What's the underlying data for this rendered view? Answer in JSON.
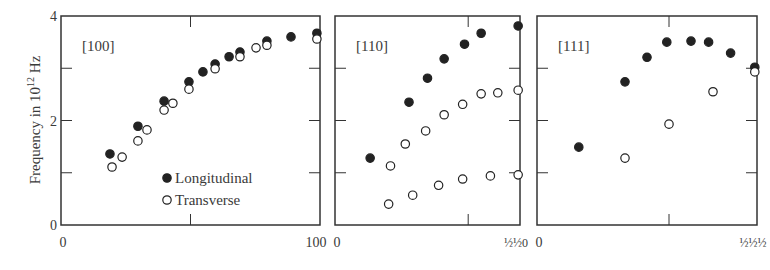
{
  "chart_data": {
    "type": "scatter",
    "ylabel": "Frequency in 10^12 Hz",
    "ylabel_main": "Frequency in 10",
    "ylabel_sup": "12",
    "ylabel_unit": "Hz",
    "ylim": [
      0,
      4
    ],
    "yticks": [
      "0",
      "2",
      "4"
    ],
    "legend": [
      {
        "name": "Longitudinal",
        "marker": "filled-circle"
      },
      {
        "name": "Transverse",
        "marker": "open-circle"
      }
    ],
    "panels": [
      {
        "title": "[100]",
        "xlim": [
          0,
          100
        ],
        "xtick_left": "0",
        "xtick_right": "100",
        "series": [
          {
            "name": "Longitudinal",
            "points": [
              [
                18.9,
                1.36
              ],
              [
                29.7,
                1.89
              ],
              [
                39.8,
                2.37
              ],
              [
                49.4,
                2.74
              ],
              [
                54.8,
                2.93
              ],
              [
                59.5,
                3.08
              ],
              [
                64.9,
                3.22
              ],
              [
                69.1,
                3.31
              ],
              [
                79.5,
                3.52
              ],
              [
                88.8,
                3.6
              ],
              [
                98.8,
                3.67
              ]
            ]
          },
          {
            "name": "Transverse",
            "points": [
              [
                19.7,
                1.11
              ],
              [
                23.6,
                1.3
              ],
              [
                29.7,
                1.61
              ],
              [
                33.2,
                1.82
              ],
              [
                39.8,
                2.2
              ],
              [
                43.2,
                2.33
              ],
              [
                49.4,
                2.6
              ],
              [
                59.5,
                2.99
              ],
              [
                69.1,
                3.22
              ],
              [
                75.3,
                3.39
              ],
              [
                79.5,
                3.44
              ],
              [
                98.8,
                3.56
              ]
            ]
          }
        ]
      },
      {
        "title": "[110]",
        "xlim": [
          0,
          1
        ],
        "xtick_left": "0",
        "xtick_right": "½½0",
        "series": [
          {
            "name": "Longitudinal",
            "points": [
              [
                0.19,
                1.28
              ],
              [
                0.4,
                2.35
              ],
              [
                0.5,
                2.81
              ],
              [
                0.59,
                3.18
              ],
              [
                0.7,
                3.46
              ],
              [
                0.79,
                3.67
              ],
              [
                0.99,
                3.81
              ]
            ]
          },
          {
            "name": "Transverse",
            "points": [
              [
                0.3,
                1.13
              ],
              [
                0.38,
                1.55
              ],
              [
                0.49,
                1.8
              ],
              [
                0.59,
                2.11
              ],
              [
                0.69,
                2.31
              ],
              [
                0.79,
                2.51
              ],
              [
                0.88,
                2.53
              ],
              [
                0.99,
                2.58
              ],
              [
                0.29,
                0.4
              ],
              [
                0.42,
                0.57
              ],
              [
                0.56,
                0.76
              ],
              [
                0.69,
                0.88
              ],
              [
                0.84,
                0.94
              ],
              [
                0.99,
                0.96
              ]
            ]
          }
        ]
      },
      {
        "title": "[111]",
        "xlim": [
          0,
          1
        ],
        "xtick_left": "0",
        "xtick_right": "½½½",
        "series": [
          {
            "name": "Longitudinal",
            "points": [
              [
                0.19,
                1.49
              ],
              [
                0.4,
                2.74
              ],
              [
                0.5,
                3.21
              ],
              [
                0.59,
                3.5
              ],
              [
                0.7,
                3.52
              ],
              [
                0.78,
                3.5
              ],
              [
                0.88,
                3.29
              ],
              [
                0.99,
                3.02
              ]
            ]
          },
          {
            "name": "Transverse",
            "points": [
              [
                0.4,
                1.28
              ],
              [
                0.6,
                1.93
              ],
              [
                0.8,
                2.55
              ],
              [
                0.99,
                2.93
              ]
            ]
          }
        ]
      }
    ]
  },
  "layout": {
    "panels_px": [
      {
        "x0": 61,
        "x1": 320,
        "midtick": 0.5
      },
      {
        "x0": 335,
        "x1": 520,
        "midtick": 0.72
      },
      {
        "x0": 537,
        "x1": 757,
        "midtick": 0.6
      }
    ],
    "y_top": 16,
    "y_bottom": 225,
    "axis_color": "#333333",
    "marker_color": "#222222"
  }
}
